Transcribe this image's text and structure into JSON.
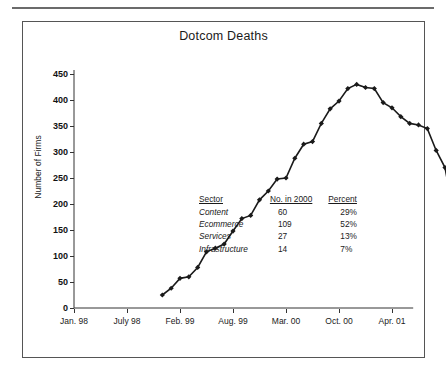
{
  "chart_data": {
    "type": "line",
    "title": "Dotcom Deaths",
    "xlabel": "",
    "ylabel": "Number of Firms",
    "ylim": [
      0,
      450
    ],
    "ytick_values": [
      0,
      50,
      100,
      150,
      200,
      250,
      300,
      350,
      400,
      450
    ],
    "ytick_labels": [
      "0",
      "50",
      "100",
      "150",
      "200",
      "250",
      "300",
      "350",
      "400",
      "450"
    ],
    "xtick_labels": [
      "Jan. 98",
      "July 98",
      "Feb. 99",
      "Aug. 99",
      "Mar. 00",
      "Oct. 00",
      "Apr. 01"
    ],
    "grid": false,
    "legend": "none",
    "marker": "filled-diamond",
    "line_color": "#1a1a1a",
    "x": [
      10,
      11,
      12,
      13,
      14,
      15,
      16,
      17,
      18,
      19,
      20,
      21,
      22,
      23,
      24,
      25,
      26,
      27,
      28,
      29,
      30,
      31,
      32,
      33,
      34,
      35,
      36,
      37,
      38,
      39,
      40,
      41,
      42,
      43
    ],
    "values": [
      25,
      38,
      57,
      60,
      78,
      108,
      115,
      123,
      148,
      172,
      178,
      208,
      225,
      248,
      250,
      288,
      315,
      320,
      355,
      383,
      398,
      422,
      430,
      424,
      422,
      395,
      385,
      368,
      355,
      352,
      345,
      303,
      270,
      180
    ]
  },
  "sector_table": {
    "headers": {
      "sector": "Sector",
      "number": "No. in 2000",
      "percent": "Percent"
    },
    "rows": [
      {
        "sector": "Content",
        "number": "60",
        "percent": "29%"
      },
      {
        "sector": "Ecommerce",
        "number": "109",
        "percent": "52%"
      },
      {
        "sector": "Services",
        "number": "27",
        "percent": "13%"
      },
      {
        "sector": "Infrastructure",
        "number": "14",
        "percent": "7%"
      }
    ]
  }
}
